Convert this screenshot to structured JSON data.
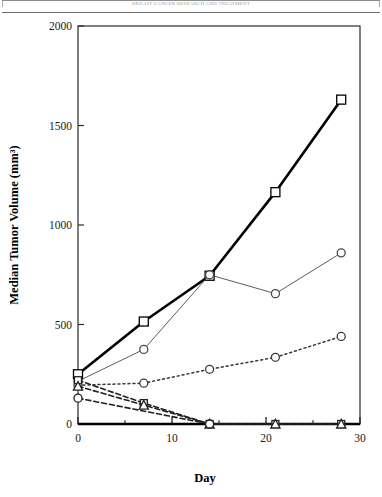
{
  "page": {
    "running_header": "BREAST CANCER RESEARCH AND TREATMENT",
    "background": "#ffffff"
  },
  "chart_data": {
    "type": "line",
    "title": "",
    "subtitle": "",
    "xlabel": "Day",
    "ylabel": "Median Tumor Volume (mm³)",
    "xlim": [
      0,
      30
    ],
    "ylim": [
      0,
      2000
    ],
    "xticks": [
      0,
      10,
      20,
      30
    ],
    "xtick_labels": [
      "0",
      "10",
      "20",
      "30"
    ],
    "xminor_ticks": [
      5,
      15,
      25
    ],
    "yticks": [
      0,
      500,
      1000,
      1500,
      2000
    ],
    "ytick_labels": [
      "0",
      "500",
      "1000",
      "1500",
      "2000"
    ],
    "grid": false,
    "legend": "none",
    "legend_position": "none",
    "annotations": [],
    "x": [
      0,
      7,
      14,
      21,
      28
    ],
    "series": [
      {
        "name": "Control",
        "marker": "open-square",
        "marker_size": 9,
        "line_style": "solid",
        "line_width": 2.6,
        "color": "#000000",
        "x": [
          0,
          7,
          14,
          21,
          28
        ],
        "values": [
          250,
          515,
          745,
          1165,
          1630
        ]
      },
      {
        "name": "Treatment A",
        "marker": "open-circle",
        "marker_size": 8,
        "line_style": "solid-thin",
        "line_width": 0.9,
        "color": "#4a4a4a",
        "x": [
          0,
          7,
          14,
          21,
          28
        ],
        "values": [
          215,
          375,
          750,
          655,
          860
        ]
      },
      {
        "name": "Treatment B",
        "marker": "open-circle",
        "marker_size": 8,
        "line_style": "dotted",
        "line_width": 1.5,
        "color": "#3a3a3a",
        "x": [
          0,
          7,
          14,
          21,
          28
        ],
        "values": [
          195,
          205,
          275,
          335,
          440
        ]
      },
      {
        "name": "Treatment C",
        "marker": "open-square",
        "marker_size": 7,
        "line_style": "dashed",
        "line_width": 1.6,
        "color": "#222222",
        "x": [
          0,
          7,
          14,
          21,
          28
        ],
        "values": [
          220,
          105,
          0,
          0,
          0
        ]
      },
      {
        "name": "Treatment D",
        "marker": "open-triangle",
        "marker_size": 8,
        "line_style": "dashed",
        "line_width": 1.6,
        "color": "#222222",
        "x": [
          0,
          7,
          14,
          21,
          28
        ],
        "values": [
          190,
          95,
          0,
          0,
          0
        ]
      },
      {
        "name": "Treatment E",
        "marker": "open-circle",
        "marker_size": 8,
        "line_style": "dashed",
        "line_width": 1.6,
        "color": "#222222",
        "x": [
          0,
          14
        ],
        "values": [
          130,
          0
        ]
      }
    ]
  }
}
